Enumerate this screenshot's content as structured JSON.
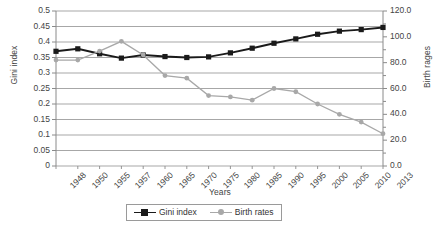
{
  "chart_data": {
    "type": "line",
    "title": "",
    "xlabel": "Years",
    "categories": [
      "1948",
      "1950",
      "1955",
      "1957",
      "1960",
      "1965",
      "1970",
      "1975",
      "1980",
      "1985",
      "1990",
      "1995",
      "2000",
      "2005",
      "2010",
      "2013"
    ],
    "grid": true,
    "legend_position": "bottom",
    "axes": {
      "left": {
        "label": "Gini index",
        "ylim": [
          0,
          0.5
        ],
        "ticks": [
          "0",
          "0.05",
          "0.1",
          "0.15",
          "0.2",
          "0.25",
          "0.3",
          "0.35",
          "0.4",
          "0.45",
          "0.5"
        ],
        "tick_values": [
          0,
          0.05,
          0.1,
          0.15,
          0.2,
          0.25,
          0.3,
          0.35,
          0.4,
          0.45,
          0.5
        ]
      },
      "right": {
        "label": "Birth rages",
        "ylim": [
          0,
          120
        ],
        "ticks": [
          "0.0",
          "20.0",
          "40.0",
          "60.0",
          "80.0",
          "100.0",
          "120.0"
        ],
        "tick_values": [
          0,
          20,
          40,
          60,
          80,
          100,
          120
        ],
        "minor_tick_values": [
          10,
          30,
          50,
          70,
          90,
          110
        ]
      }
    },
    "series": [
      {
        "name": "Gini index",
        "axis": "left",
        "color": "#1a1a1a",
        "marker": "square",
        "values": [
          0.37,
          0.378,
          0.362,
          0.348,
          0.358,
          0.353,
          0.35,
          0.352,
          0.365,
          0.38,
          0.396,
          0.41,
          0.425,
          0.435,
          0.44,
          0.447
        ]
      },
      {
        "name": "Birth rates",
        "axis": "right",
        "color": "#a8a8a8",
        "marker": "circle",
        "values": [
          82.0,
          82.0,
          89.0,
          96.5,
          86.0,
          70.0,
          68.0,
          54.5,
          53.5,
          51.0,
          60.0,
          57.5,
          48.0,
          40.0,
          34.0,
          25.0
        ]
      }
    ]
  },
  "legend": {
    "entries": [
      {
        "label": "Gini index"
      },
      {
        "label": "Birth rates"
      }
    ]
  },
  "caption": ""
}
